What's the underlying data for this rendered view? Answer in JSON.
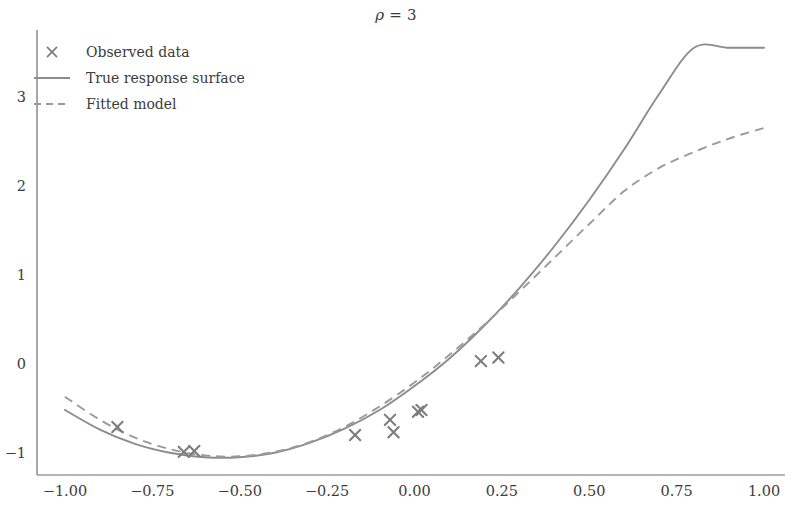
{
  "chart_data": {
    "type": "scatter",
    "title": "ρ = 3",
    "title_symbol": "ρ",
    "title_rest": " = 3",
    "xlabel": "",
    "ylabel": "",
    "xlim": [
      -1.08,
      1.06
    ],
    "ylim": [
      -1.25,
      3.75
    ],
    "grid": false,
    "legend_position": "upper left",
    "xticks": [
      -1.0,
      -0.75,
      -0.5,
      -0.25,
      0.0,
      0.25,
      0.5,
      0.75,
      1.0
    ],
    "xticklabels": [
      "−1.00",
      "−0.75",
      "−0.50",
      "−0.25",
      "0.00",
      "0.25",
      "0.50",
      "0.75",
      "1.00"
    ],
    "yticks": [
      -1,
      0,
      1,
      2,
      3
    ],
    "yticklabels": [
      "−1",
      "0",
      "1",
      "2",
      "3"
    ],
    "legend": [
      {
        "label": "Observed data",
        "style": "marker",
        "marker": "x",
        "color": "#7d7d7d"
      },
      {
        "label": "True response surface",
        "style": "solid",
        "color": "#8c8c8c"
      },
      {
        "label": "Fitted model",
        "style": "dashed",
        "color": "#9a9a9a"
      }
    ],
    "series": [
      {
        "name": "Observed data",
        "style": "scatter",
        "marker": "x",
        "x": [
          -0.85,
          -0.66,
          -0.63,
          -0.17,
          -0.07,
          -0.06,
          0.01,
          0.02,
          0.19,
          0.24
        ],
        "y": [
          -0.71,
          -0.99,
          -0.98,
          -0.8,
          -0.63,
          -0.77,
          -0.54,
          -0.52,
          0.03,
          0.07
        ]
      },
      {
        "name": "True response surface",
        "style": "solid",
        "x": [
          -1.0,
          -0.9,
          -0.8,
          -0.7,
          -0.6,
          -0.5,
          -0.4,
          -0.3,
          -0.2,
          -0.1,
          0.0,
          0.1,
          0.2,
          0.3,
          0.4,
          0.5,
          0.6,
          0.7,
          0.8,
          0.9,
          1.0
        ],
        "y": [
          -0.52,
          -0.74,
          -0.9,
          -1.0,
          -1.05,
          -1.05,
          -1.0,
          -0.89,
          -0.73,
          -0.52,
          -0.25,
          0.06,
          0.43,
          0.85,
          1.32,
          1.84,
          2.41,
          3.03,
          3.55,
          3.55,
          3.55
        ]
      },
      {
        "name": "Fitted model",
        "style": "dashed",
        "x": [
          -1.0,
          -0.9,
          -0.8,
          -0.7,
          -0.6,
          -0.5,
          -0.4,
          -0.3,
          -0.2,
          -0.1,
          0.0,
          0.1,
          0.2,
          0.3,
          0.4,
          0.5,
          0.6,
          0.7,
          0.8,
          0.9,
          1.0
        ],
        "y": [
          -0.37,
          -0.63,
          -0.83,
          -0.96,
          -1.03,
          -1.04,
          -0.99,
          -0.88,
          -0.71,
          -0.48,
          -0.21,
          0.1,
          0.44,
          0.81,
          1.19,
          1.57,
          1.94,
          2.2,
          2.38,
          2.53,
          2.65
        ]
      }
    ]
  }
}
